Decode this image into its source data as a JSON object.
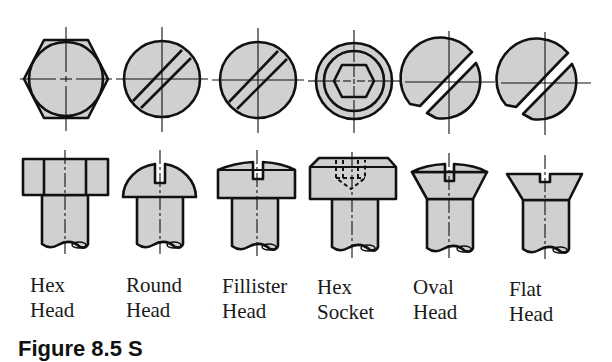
{
  "figure": {
    "colors": {
      "fill": "#d0d0d0",
      "stroke": "#111111",
      "background": "#ffffff"
    },
    "screw_heads": [
      {
        "id": "hex-head",
        "label_line1": "Hex",
        "label_line2": "Head",
        "top_view": "hexagon with inscribed circle",
        "side_view": "rectangular head with hex flats"
      },
      {
        "id": "round-head",
        "label_line1": "Round",
        "label_line2": "Head",
        "top_view": "circle with diagonal slot",
        "side_view": "domed head with slot"
      },
      {
        "id": "fillister-head",
        "label_line1": "Fillister",
        "label_line2": "Head",
        "top_view": "circle with diagonal slot",
        "side_view": "cylindrical head with rounded top and slot"
      },
      {
        "id": "hex-socket",
        "label_line1": "Hex",
        "label_line2": "Socket",
        "top_view": "concentric circles with hexagon socket",
        "side_view": "cylindrical head with hidden-line hex socket"
      },
      {
        "id": "oval-head",
        "label_line1": "Oval",
        "label_line2": "Head",
        "top_view": "circle with offset diagonal slot",
        "side_view": "countersunk head with domed top and slot"
      },
      {
        "id": "flat-head",
        "label_line1": "Flat",
        "label_line2": "Head",
        "top_view": "circle with offset diagonal slot",
        "side_view": "countersunk flat head with slot"
      }
    ],
    "caption_partial": "Figure 8.5  S"
  }
}
